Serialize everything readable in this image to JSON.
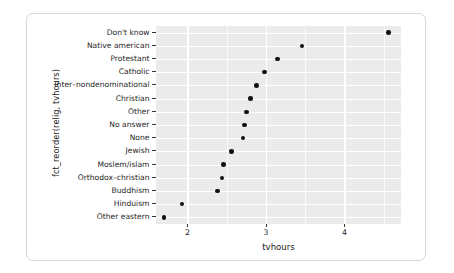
{
  "chart_data": {
    "type": "scatter",
    "title": "",
    "subtitle": "",
    "xlabel": "tvhours",
    "ylabel": "fct_reorder(relig, tvhours)",
    "orientation": "horizontal-dotplot",
    "grid": "major and minor vertical gridlines, major horizontal gridlines",
    "legend": "none",
    "xlim": [
      1.6,
      4.72
    ],
    "xticks": [
      2,
      3,
      4
    ],
    "xtick_labels": [
      "2",
      "3",
      "4"
    ],
    "xminor_ticks": [
      1.5,
      2.5,
      3.5,
      4.5
    ],
    "categories": [
      "Don't know",
      "Native american",
      "Protestant",
      "Catholic",
      "Inter–nondenominational",
      "Christian",
      "Other",
      "No answer",
      "None",
      "Jewish",
      "Moslem/islam",
      "Orthodox–christian",
      "Buddhism",
      "Hinduism",
      "Other eastern"
    ],
    "values": [
      4.56,
      3.46,
      3.15,
      2.98,
      2.88,
      2.8,
      2.75,
      2.73,
      2.71,
      2.56,
      2.46,
      2.44,
      2.38,
      1.93,
      1.7
    ],
    "point_color": "#111111",
    "panel_background": "#ebebeb",
    "gridline_color": "#ffffff"
  }
}
